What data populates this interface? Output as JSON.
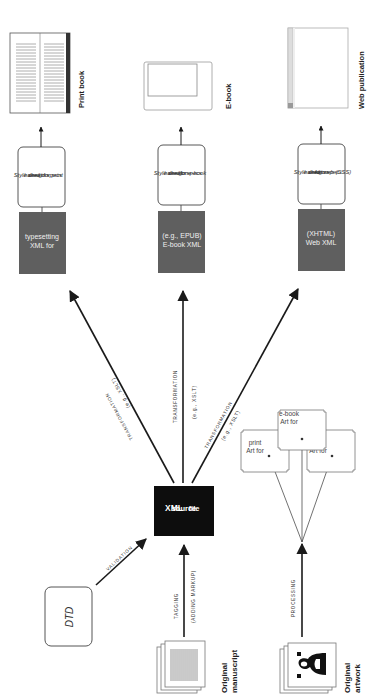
{
  "diagram": {
    "orientation": "rotated 90deg counter-clockwise",
    "colors": {
      "process_box": "#5f5f5f",
      "source_box": "#0d0d0d",
      "line": "#1a1a1a",
      "outline": "#555555",
      "background": "#ffffff"
    },
    "inputs": {
      "dtd": {
        "label": "DTD"
      },
      "manuscript": {
        "label_line1": "Original",
        "label_line2": "manuscript"
      },
      "artwork": {
        "label_line1": "Original",
        "label_line2": "artwork"
      }
    },
    "edges_in": {
      "validation": {
        "label": "VALIDATION"
      },
      "tagging": {
        "label_line1": "TAGGING",
        "label_line2": "(ADDING MARKUP)"
      },
      "processing": {
        "label": "PROCESSING"
      }
    },
    "source": {
      "line1": "XML",
      "line2": "source",
      "line3": "file"
    },
    "art_outputs": [
      {
        "line1": "Art for",
        "line2": "print"
      },
      {
        "line1": "Art for",
        "line2": "e-book"
      },
      {
        "line1": "Art for",
        "line2": "web"
      }
    ],
    "transformations": [
      {
        "label": "TRANSFORMATION",
        "sub": "(e.g., XSLT)"
      },
      {
        "label": "TRANSFORMATION",
        "sub": "(e.g., XSLT)"
      },
      {
        "label": "TRANSFORMATION",
        "sub": "(e.g., XSLT)"
      }
    ],
    "outputs": [
      {
        "xml_line1": "XML for",
        "xml_line2": "typesetting",
        "style_lines": [
          "Style sheet",
          "based on",
          "design specs",
          "for print"
        ],
        "product": "Print book"
      },
      {
        "xml_line1": "E-book XML",
        "xml_line2": "(e.g., EPUB)",
        "style_lines": [
          "Style sheet",
          "based on",
          "design specs",
          "for e-book"
        ],
        "product": "E-book"
      },
      {
        "xml_line1": "Web XML",
        "xml_line2": "(XHTML)",
        "style_lines": [
          "Style sheet",
          "based on",
          "design specs",
          "for web (CSS)"
        ],
        "product": "Web publication"
      }
    ]
  }
}
